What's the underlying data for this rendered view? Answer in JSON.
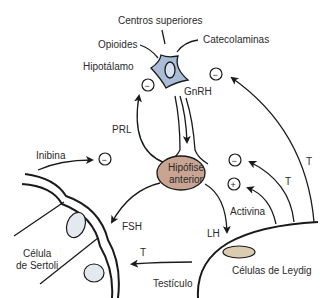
{
  "colors": {
    "neuron_fill": "#a9bdd6",
    "neuron_nucleus": "#d8e2ee",
    "pituitary_fill": "#c9a493",
    "leydig_fill": "#d9ccb0",
    "sertoli_nucleus": "#e6e8ef",
    "stroke": "#1a1a1a"
  },
  "labels": {
    "higher_centers": "Centros superiores",
    "opioids": "Opioides",
    "catecholamines": "Catecolaminas",
    "hypothalamus": "Hipotálamo",
    "gnrh": "GnRH",
    "prl": "PRL",
    "inhibin": "Inibina",
    "pituitary_line1": "Hipófise",
    "pituitary_line2": "anterior",
    "fsh": "FSH",
    "lh": "LH",
    "activin": "Activina",
    "t_upper": "T",
    "t_middle": "T",
    "t_lower": "T",
    "sertoli_line1": "Célula",
    "sertoli_line2": "de Sertoli",
    "leydig": "Células de Leydig",
    "testis": "Testículo"
  },
  "signs": {
    "hypothalamus_prl": "−",
    "hypothalamus_t": "−",
    "inhibin": "−",
    "pituitary_t": "−",
    "activin": "+"
  }
}
